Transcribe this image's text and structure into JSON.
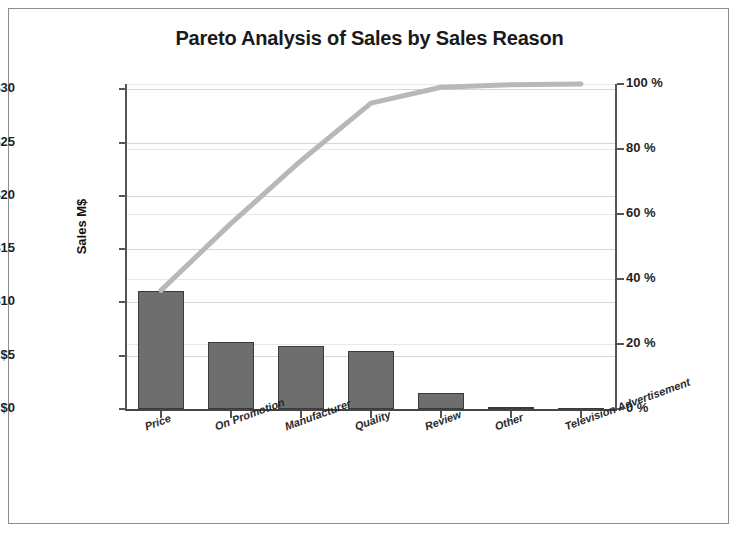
{
  "chart_data": {
    "type": "bar",
    "title": "Pareto Analysis of Sales by Sales Reason",
    "xlabel": "",
    "ylabel": "Sales M$",
    "y2label": "",
    "categories": [
      "Price",
      "On Promotion",
      "Manufacturer",
      "Quality",
      "Review",
      "Other",
      "Television Advertisement"
    ],
    "values": [
      11.1,
      6.3,
      5.9,
      5.4,
      1.5,
      0.15,
      0.05
    ],
    "cumulative_percent": [
      36.5,
      57.1,
      76.4,
      94.1,
      99.0,
      99.8,
      100.0
    ],
    "series": [
      {
        "name": "Sales M$",
        "type": "bar",
        "values": [
          11.1,
          6.3,
          5.9,
          5.4,
          1.5,
          0.15,
          0.05
        ]
      },
      {
        "name": "Cumulative %",
        "type": "line",
        "values": [
          36.5,
          57.1,
          76.4,
          94.1,
          99.0,
          99.8,
          100.0
        ]
      }
    ],
    "ylim": [
      0,
      30.5
    ],
    "y2lim": [
      0,
      100
    ],
    "yticks": [
      0,
      5,
      10,
      15,
      20,
      25,
      30
    ],
    "ytick_labels": [
      "$0",
      "$5",
      "$10",
      "$15",
      "$20",
      "$25",
      "$30"
    ],
    "y2ticks": [
      0,
      20,
      40,
      60,
      80,
      100
    ],
    "y2tick_labels": [
      "0 %",
      "20 %",
      "40 %",
      "60 %",
      "80 %",
      "100 %"
    ],
    "grid": true,
    "legend": "none",
    "bar_color": "#6e6e6e",
    "bar_edge_color": "#3b3b3b",
    "line_color": "#b8b8b8",
    "grid_color": "#d5d5d5",
    "axis_color": "#555555",
    "frame_color": "#8d8d8d",
    "background": "#ffffff"
  }
}
